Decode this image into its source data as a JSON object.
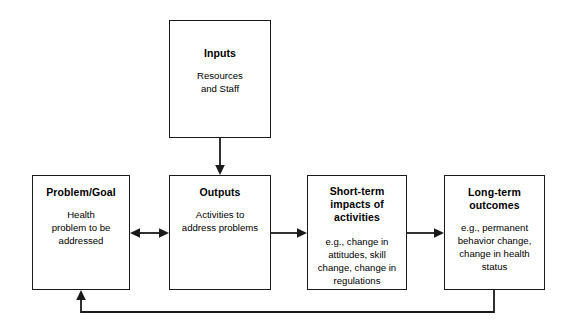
{
  "diagram": {
    "type": "flowchart",
    "colors": {
      "line": "#1a1a1a",
      "text": "#000000",
      "background": "#ffffff"
    },
    "nodes": [
      {
        "id": "inputs",
        "title": "Inputs",
        "body": "Resources\nand Staff"
      },
      {
        "id": "problem_goal",
        "title": "Problem/Goal",
        "body": "Health\nproblem to be\naddressed"
      },
      {
        "id": "outputs",
        "title": "Outputs",
        "body": "Activities to\naddress problems"
      },
      {
        "id": "short_term_impacts",
        "title": "Short-term\nimpacts of\nactivities",
        "body": "e.g., change in\nattitudes, skill\nchange, change in\nregulations"
      },
      {
        "id": "long_term_outcomes",
        "title": "Long-term\noutcomes",
        "body": "e.g., permanent\nbehavior change,\nchange in health\nstatus"
      }
    ],
    "edges": [
      {
        "id": "inputs_to_outputs",
        "from": "inputs",
        "to": "outputs",
        "style": "arrow-down"
      },
      {
        "id": "problem_outputs",
        "from": "problem_goal",
        "to": "outputs",
        "style": "double-arrow"
      },
      {
        "id": "outputs_to_short_term",
        "from": "outputs",
        "to": "short_term_impacts",
        "style": "arrow-right"
      },
      {
        "id": "short_term_to_long_term",
        "from": "short_term_impacts",
        "to": "long_term_outcomes",
        "style": "arrow-right"
      },
      {
        "id": "feedback_loop",
        "from": "long_term_outcomes",
        "to": "problem_goal",
        "style": "feedback-arrow-up"
      }
    ]
  }
}
